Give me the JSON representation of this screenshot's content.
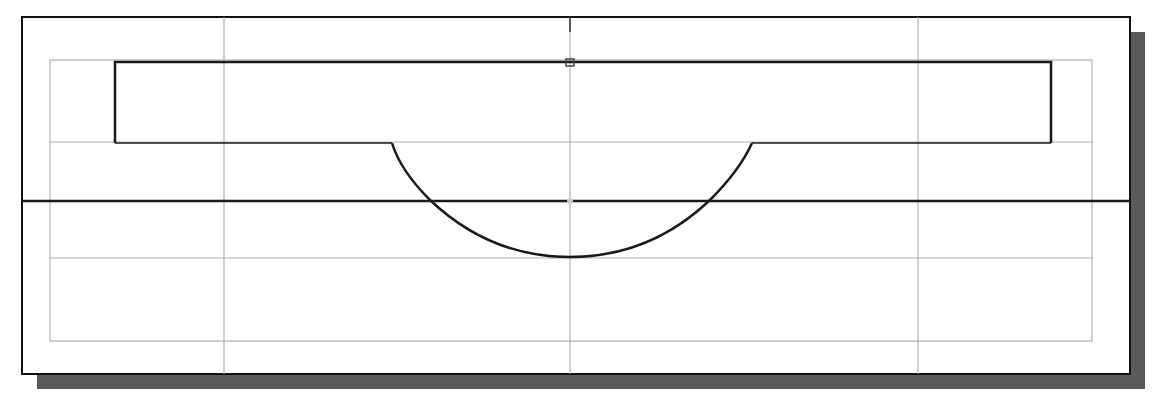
{
  "diagram": {
    "type": "cad-sketch",
    "colors": {
      "background": "#ffffff",
      "frame": "#111111",
      "shadow": "#5a5a5a",
      "grid": "#b0b0b0",
      "geometry": "#1a1a1a",
      "marker": "#9a9a9a"
    },
    "frame": {
      "x": 22,
      "y": 17,
      "width": 1108,
      "height": 357
    },
    "shadow": {
      "offset": 15
    },
    "grid": {
      "outer": {
        "x": 50,
        "y": 60,
        "width": 1042,
        "height": 281
      },
      "h_lines_y": [
        142,
        258
      ],
      "v_lines_x": [
        224,
        570,
        918
      ]
    },
    "rectangle": {
      "x": 115,
      "y": 62,
      "width": 936,
      "height": 81
    },
    "axis": {
      "y": 201,
      "x1": 22,
      "x2": 1130
    },
    "center_tick": {
      "x": 570,
      "y1": 17,
      "y2": 32
    },
    "arc": {
      "x1": 392,
      "x2": 752,
      "y_top": 143,
      "y_bottom": 257
    },
    "origin_marker": {
      "x": 570,
      "y": 201
    }
  }
}
